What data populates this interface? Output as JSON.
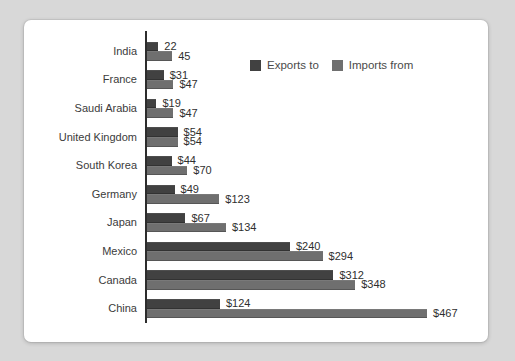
{
  "page": {
    "background_color": "#d8d8d8",
    "card_color": "#ffffff"
  },
  "chart_data": {
    "type": "bar",
    "orientation": "horizontal",
    "title": "",
    "xlabel": "",
    "ylabel": "",
    "grid": false,
    "legend_position": "top-center-of-plot",
    "xlim": [
      0,
      480
    ],
    "categories": [
      "India",
      "France",
      "Saudi Arabia",
      "United Kingdom",
      "South Korea",
      "Germany",
      "Japan",
      "Mexico",
      "Canada",
      "China"
    ],
    "series": [
      {
        "name": "Exports to",
        "color": "#414141",
        "values": [
          22,
          31,
          19,
          54,
          44,
          49,
          67,
          240,
          312,
          124
        ],
        "labels": [
          "22",
          "$31",
          "$19",
          "$54",
          "$44",
          "$49",
          "$67",
          "$240",
          "$312",
          "$124"
        ]
      },
      {
        "name": "Imports from",
        "color": "#6f6f6f",
        "values": [
          45,
          47,
          47,
          54,
          70,
          123,
          134,
          294,
          348,
          467
        ],
        "labels": [
          "45",
          "$47",
          "$47",
          "$54",
          "$70",
          "$123",
          "$134",
          "$294",
          "$348",
          "$467"
        ]
      }
    ]
  }
}
